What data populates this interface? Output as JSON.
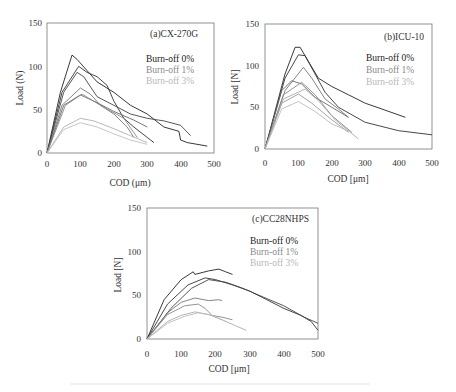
{
  "chart_data": [
    {
      "type": "line",
      "panel": "a",
      "title": "(a)CX-270G",
      "xlabel": "COD (μm)",
      "ylabel": "Load (N)",
      "xlim": [
        0,
        500
      ],
      "ylim": [
        0,
        150
      ],
      "xticks": [
        0,
        100,
        200,
        300,
        400,
        500
      ],
      "yticks": [
        0,
        50,
        100,
        150
      ],
      "grid": false,
      "legend": [
        "Burn-off 0%",
        "Burn-off 1%",
        "Burn-off 3%"
      ],
      "legend_position": "upper right",
      "series": [
        {
          "name": "Burn-off 0%",
          "color": "#222222",
          "points": [
            [
              0,
              0
            ],
            [
              40,
              70
            ],
            [
              75,
              113
            ],
            [
              90,
              108
            ],
            [
              120,
              95
            ],
            [
              150,
              82
            ],
            [
              200,
              70
            ],
            [
              250,
              55
            ],
            [
              300,
              45
            ],
            [
              350,
              30
            ],
            [
              395,
              25
            ],
            [
              400,
              15
            ],
            [
              420,
              12
            ],
            [
              480,
              8
            ]
          ]
        },
        {
          "name": "Burn-off 0%",
          "color": "#333333",
          "points": [
            [
              0,
              0
            ],
            [
              45,
              70
            ],
            [
              95,
              100
            ],
            [
              120,
              93
            ],
            [
              150,
              88
            ],
            [
              180,
              78
            ],
            [
              200,
              60
            ],
            [
              230,
              40
            ],
            [
              260,
              30
            ],
            [
              300,
              18
            ],
            [
              320,
              12
            ]
          ]
        },
        {
          "name": "Burn-off 0%",
          "color": "#444444",
          "points": [
            [
              0,
              0
            ],
            [
              50,
              70
            ],
            [
              90,
              93
            ],
            [
              110,
              88
            ],
            [
              150,
              65
            ],
            [
              200,
              55
            ],
            [
              250,
              45
            ],
            [
              300,
              40
            ],
            [
              350,
              37
            ],
            [
              400,
              32
            ],
            [
              430,
              20
            ]
          ]
        },
        {
          "name": "Burn-off 1%",
          "color": "#777777",
          "points": [
            [
              0,
              0
            ],
            [
              45,
              55
            ],
            [
              100,
              75
            ],
            [
              130,
              68
            ],
            [
              160,
              55
            ],
            [
              200,
              45
            ],
            [
              240,
              30
            ],
            [
              260,
              18
            ]
          ]
        },
        {
          "name": "Burn-off 1%",
          "color": "#666666",
          "points": [
            [
              0,
              0
            ],
            [
              50,
              55
            ],
            [
              100,
              67
            ],
            [
              150,
              58
            ],
            [
              200,
              48
            ],
            [
              260,
              38
            ],
            [
              300,
              30
            ]
          ]
        },
        {
          "name": "Burn-off 1%",
          "color": "#888888",
          "points": [
            [
              0,
              0
            ],
            [
              55,
              55
            ],
            [
              105,
              68
            ],
            [
              160,
              55
            ],
            [
              230,
              40
            ],
            [
              270,
              18
            ]
          ]
        },
        {
          "name": "Burn-off 3%",
          "color": "#b0b0b0",
          "points": [
            [
              0,
              0
            ],
            [
              50,
              30
            ],
            [
              100,
              40
            ],
            [
              140,
              37
            ],
            [
              200,
              28
            ],
            [
              250,
              20
            ],
            [
              300,
              12
            ]
          ]
        },
        {
          "name": "Burn-off 3%",
          "color": "#c0c0c0",
          "points": [
            [
              0,
              0
            ],
            [
              50,
              27
            ],
            [
              100,
              35
            ],
            [
              150,
              30
            ],
            [
              200,
              22
            ],
            [
              250,
              15
            ],
            [
              300,
              10
            ]
          ]
        }
      ]
    },
    {
      "type": "line",
      "panel": "b",
      "title": "(b)ICU-10",
      "xlabel": "COD [μm]",
      "ylabel": "Load [N]",
      "xlim": [
        0,
        500
      ],
      "ylim": [
        0,
        150
      ],
      "xticks": [
        0,
        100,
        200,
        300,
        400,
        500
      ],
      "yticks": [
        0,
        50,
        100,
        150
      ],
      "grid": false,
      "legend": [
        "Burn-off 0%",
        "Burn-off 1%",
        "Burn-off 3%"
      ],
      "legend_position": "upper right",
      "series": [
        {
          "name": "Burn-off 0%",
          "color": "#222222",
          "points": [
            [
              0,
              0
            ],
            [
              60,
              90
            ],
            [
              90,
              122
            ],
            [
              105,
              122
            ],
            [
              130,
              105
            ],
            [
              160,
              85
            ],
            [
              200,
              75
            ],
            [
              250,
              65
            ],
            [
              300,
              55
            ],
            [
              350,
              48
            ],
            [
              420,
              38
            ]
          ]
        },
        {
          "name": "Burn-off 0%",
          "color": "#333333",
          "points": [
            [
              0,
              0
            ],
            [
              60,
              85
            ],
            [
              100,
              113
            ],
            [
              120,
              112
            ],
            [
              150,
              90
            ],
            [
              180,
              68
            ],
            [
              220,
              50
            ],
            [
              300,
              32
            ],
            [
              400,
              22
            ],
            [
              500,
              17
            ]
          ]
        },
        {
          "name": "Burn-off 1%",
          "color": "#777777",
          "points": [
            [
              0,
              0
            ],
            [
              60,
              70
            ],
            [
              115,
              98
            ],
            [
              140,
              85
            ],
            [
              180,
              60
            ],
            [
              220,
              48
            ],
            [
              250,
              38
            ]
          ]
        },
        {
          "name": "Burn-off 1%",
          "color": "#666666",
          "points": [
            [
              0,
              0
            ],
            [
              50,
              70
            ],
            [
              80,
              82
            ],
            [
              110,
              78
            ],
            [
              150,
              62
            ],
            [
              200,
              50
            ],
            [
              250,
              38
            ]
          ]
        },
        {
          "name": "Burn-off 1%",
          "color": "#888888",
          "points": [
            [
              0,
              0
            ],
            [
              55,
              65
            ],
            [
              110,
              80
            ],
            [
              150,
              65
            ],
            [
              200,
              40
            ],
            [
              260,
              20
            ]
          ]
        },
        {
          "name": "Burn-off 3%",
          "color": "#999999",
          "points": [
            [
              0,
              0
            ],
            [
              50,
              55
            ],
            [
              100,
              66
            ],
            [
              140,
              55
            ],
            [
              200,
              35
            ],
            [
              250,
              20
            ]
          ]
        },
        {
          "name": "Burn-off 3%",
          "color": "#aaaaaa",
          "points": [
            [
              0,
              0
            ],
            [
              55,
              60
            ],
            [
              120,
              72
            ],
            [
              160,
              58
            ],
            [
              210,
              35
            ],
            [
              280,
              12
            ]
          ]
        },
        {
          "name": "Burn-off 3%",
          "color": "#bbbbbb",
          "points": [
            [
              0,
              0
            ],
            [
              50,
              48
            ],
            [
              100,
              57
            ],
            [
              150,
              45
            ],
            [
              200,
              30
            ],
            [
              260,
              20
            ]
          ]
        }
      ]
    },
    {
      "type": "line",
      "panel": "c",
      "title": "(c)CC28NHPS",
      "xlabel": "COD [μm]",
      "ylabel": "Load [N]",
      "xlim": [
        0,
        500
      ],
      "ylim": [
        0,
        150
      ],
      "xticks": [
        0,
        100,
        200,
        300,
        400,
        500
      ],
      "yticks": [
        0,
        50,
        100,
        150
      ],
      "grid": false,
      "legend": [
        "Burn-off 0%",
        "Burn-off 1%",
        "Burn-off 3%"
      ],
      "legend_position": "upper right",
      "series": [
        {
          "name": "Burn-off 0%",
          "color": "#222222",
          "points": [
            [
              0,
              0
            ],
            [
              50,
              45
            ],
            [
              100,
              68
            ],
            [
              135,
              77
            ],
            [
              140,
              74
            ],
            [
              180,
              78
            ],
            [
              210,
              80
            ],
            [
              230,
              77
            ],
            [
              250,
              74
            ]
          ]
        },
        {
          "name": "Burn-off 0%",
          "color": "#333333",
          "points": [
            [
              0,
              0
            ],
            [
              60,
              40
            ],
            [
              120,
              62
            ],
            [
              170,
              70
            ],
            [
              200,
              68
            ],
            [
              250,
              62
            ],
            [
              300,
              55
            ],
            [
              350,
              45
            ],
            [
              400,
              35
            ],
            [
              450,
              27
            ],
            [
              480,
              20
            ],
            [
              500,
              10
            ]
          ]
        },
        {
          "name": "Burn-off 0%",
          "color": "#444444",
          "points": [
            [
              0,
              0
            ],
            [
              70,
              35
            ],
            [
              130,
              58
            ],
            [
              180,
              68
            ],
            [
              230,
              65
            ],
            [
              280,
              58
            ],
            [
              340,
              48
            ],
            [
              400,
              38
            ],
            [
              460,
              25
            ],
            [
              500,
              18
            ]
          ]
        },
        {
          "name": "Burn-off 1%",
          "color": "#777777",
          "points": [
            [
              0,
              0
            ],
            [
              60,
              30
            ],
            [
              100,
              42
            ],
            [
              140,
              47
            ],
            [
              180,
              44
            ],
            [
              210,
              45
            ],
            [
              220,
              44
            ]
          ]
        },
        {
          "name": "Burn-off 1%",
          "color": "#888888",
          "points": [
            [
              0,
              0
            ],
            [
              60,
              28
            ],
            [
              110,
              38
            ],
            [
              150,
              40
            ],
            [
              170,
              35
            ],
            [
              190,
              27
            ],
            [
              220,
              25
            ],
            [
              250,
              22
            ]
          ]
        },
        {
          "name": "Burn-off 3%",
          "color": "#aaaaaa",
          "points": [
            [
              0,
              0
            ],
            [
              60,
              20
            ],
            [
              100,
              27
            ],
            [
              140,
              31
            ],
            [
              180,
              28
            ],
            [
              220,
              22
            ],
            [
              260,
              15
            ],
            [
              290,
              10
            ]
          ]
        },
        {
          "name": "Burn-off 3%",
          "color": "#bbbbbb",
          "points": [
            [
              0,
              0
            ],
            [
              60,
              18
            ],
            [
              110,
              26
            ],
            [
              150,
              30
            ],
            [
              190,
              27
            ],
            [
              230,
              20
            ]
          ]
        }
      ]
    }
  ],
  "panels": {
    "a": {
      "title": "(a)CX-270G",
      "xlabel": "COD (μm)",
      "ylabel": "Load (N)"
    },
    "b": {
      "title": "(b)ICU-10",
      "xlabel": "COD [μm]",
      "ylabel": "Load [N]"
    },
    "c": {
      "title": "(c)CC28NHPS",
      "xlabel": "COD [μm]",
      "ylabel": "Load [N]"
    }
  },
  "legend": {
    "l0": "Burn-off 0%",
    "l1": "Burn-off 1%",
    "l3": "Burn-off 3%"
  },
  "ticks": {
    "x": [
      "0",
      "100",
      "200",
      "300",
      "400",
      "500"
    ],
    "y": [
      "0",
      "50",
      "100",
      "150"
    ]
  }
}
